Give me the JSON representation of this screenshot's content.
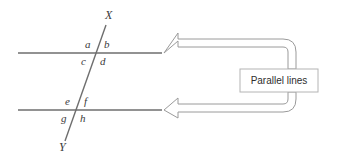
{
  "figure": {
    "type": "geometry-diagram",
    "stroke_color": "#6e6e6e",
    "text_color": "#3a3a3a",
    "background_color": "#ffffff"
  },
  "transversal": {
    "top_endpoint_label": "X",
    "bottom_endpoint_label": "Y"
  },
  "angles": {
    "upper_intersection": {
      "top_left": "a",
      "top_right": "b",
      "bottom_left": "c",
      "bottom_right": "d"
    },
    "lower_intersection": {
      "top_left": "e",
      "top_right": "f",
      "bottom_left": "g",
      "bottom_right": "h"
    }
  },
  "callout": {
    "label": "Parallel lines",
    "arrow_direction": "left",
    "arrow_count": 2
  }
}
